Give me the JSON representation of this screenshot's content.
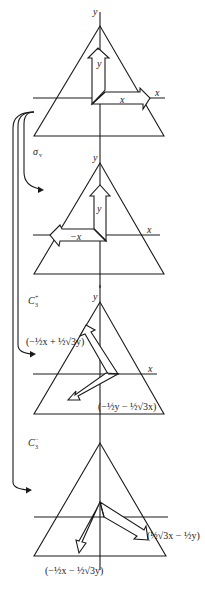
{
  "figure": {
    "panels": [
      {
        "id": "identity",
        "axis_labels": {
          "y": "y",
          "x": "x"
        },
        "arrow_labels": {
          "vertical": "y",
          "horizontal": "x"
        }
      },
      {
        "id": "sigma_v",
        "operation_label": "σ",
        "operation_subscript": "v",
        "axis_labels": {
          "y": "y",
          "x": "x"
        },
        "arrow_labels": {
          "vertical": "y",
          "horizontal": "−x"
        }
      },
      {
        "id": "C3_plus",
        "operation_label": "C",
        "operation_subscript": "3",
        "operation_superscript": "+",
        "axis_labels": {
          "y": "y",
          "x": "x"
        },
        "arrow_labels": {
          "upper_left": "(−½x + ½√3y)",
          "lower_left": "(−½y − ½√3x)"
        }
      },
      {
        "id": "C3_minus",
        "operation_label": "C",
        "operation_subscript": "3",
        "operation_superscript": "−",
        "arrow_labels": {
          "lower_right": "(½√3x − ½y)",
          "lower_left": "(−½x − ½√3y)"
        }
      }
    ]
  }
}
